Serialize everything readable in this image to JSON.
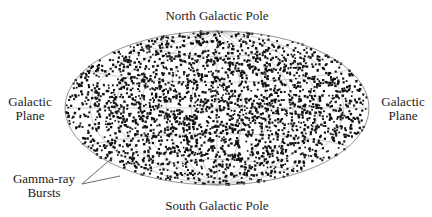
{
  "figure": {
    "title_top": "North Galactic Pole",
    "title_bottom": "South Galactic Pole",
    "left_label": [
      "Galactic",
      "Plane"
    ],
    "right_label": [
      "Galactic",
      "Plane"
    ],
    "annotation": [
      "Gamma-ray",
      "Bursts"
    ]
  },
  "projection": {
    "type": "aitoff",
    "center": [
      217,
      108
    ],
    "rx": 152,
    "ry": 77
  },
  "style": {
    "dot_color": "#111111",
    "grid_color": "#999999",
    "outline_color": "#777777",
    "text_color": "#222222"
  },
  "points": {
    "count": 2700,
    "distribution": "isotropic",
    "seed": 12345
  }
}
